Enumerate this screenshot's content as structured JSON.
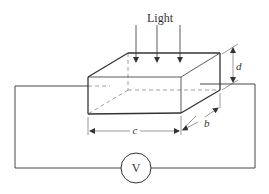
{
  "diagram": {
    "light_label": "Light",
    "dimension_labels": {
      "depth": "d",
      "length": "c",
      "width": "b"
    },
    "meter_label": "V",
    "light_arrows": 3,
    "colors": {
      "line": "#333333",
      "dashed": "#888888",
      "background": "#ffffff"
    }
  }
}
